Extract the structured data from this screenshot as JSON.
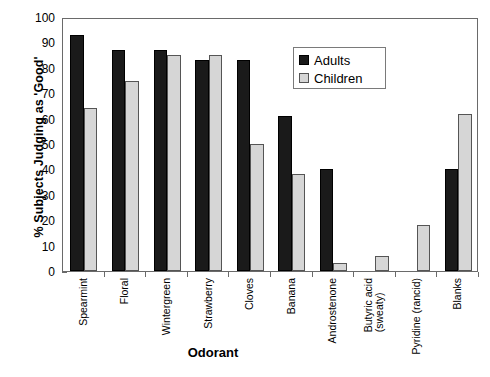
{
  "chart_data": {
    "type": "bar",
    "title": "",
    "xlabel": "Odorant",
    "ylabel": "% Subjects Judging as 'Good'",
    "ylim": [
      0,
      100
    ],
    "yticks": [
      0,
      10,
      20,
      30,
      40,
      50,
      60,
      70,
      80,
      90,
      100
    ],
    "grid": false,
    "legend_position": "top-right",
    "categories": [
      "Spearmint",
      "Floral",
      "Wintergreen",
      "Strawberry",
      "Cloves",
      "Banana",
      "Androstenone",
      "Butyric acid (sweaty)",
      "Pyridine (rancid)",
      "Blanks"
    ],
    "category_lines": [
      [
        "Spearmint"
      ],
      [
        "Floral"
      ],
      [
        "Wintergreen"
      ],
      [
        "Strawberry"
      ],
      [
        "Cloves"
      ],
      [
        "Banana"
      ],
      [
        "Androstenone"
      ],
      [
        "Butyric acid",
        "(sweaty)"
      ],
      [
        "Pyridine (rancid)"
      ],
      [
        "Blanks"
      ]
    ],
    "series": [
      {
        "name": "Adults",
        "color": "#1a1a1a",
        "values": [
          93,
          87,
          87,
          83,
          83,
          61,
          40,
          null,
          null,
          40
        ]
      },
      {
        "name": "Children",
        "color": "#d6d6d6",
        "values": [
          64,
          75,
          85,
          85,
          50,
          38,
          3,
          6,
          18,
          62
        ]
      }
    ]
  },
  "legend": {
    "items": [
      {
        "label": "Adults"
      },
      {
        "label": "Children"
      }
    ]
  },
  "colors": {
    "adults": "#1a1a1a",
    "children": "#d6d6d6",
    "axis": "#6a6a6a"
  }
}
